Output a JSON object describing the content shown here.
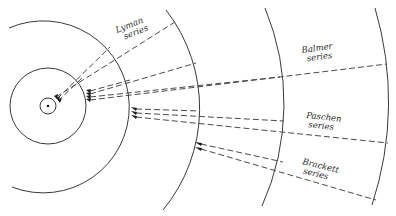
{
  "figure": {
    "type": "hydrogen-atom energy-level orbit diagram",
    "nucleus": {
      "cx": 48,
      "cy": 106
    },
    "orbits": [
      {
        "n": 1,
        "r": 8
      },
      {
        "n": 2,
        "r": 38
      },
      {
        "n": 3,
        "r": 82
      },
      {
        "n": 4,
        "r": 152
      },
      {
        "n": 5,
        "r": 238
      },
      {
        "n": 6,
        "r": 342
      }
    ],
    "series": [
      {
        "id": "lyman",
        "label_line1": "Lyman",
        "label_line2": "series",
        "target_orbit": 1
      },
      {
        "id": "balmer",
        "label_line1": "Balmer",
        "label_line2": "series",
        "target_orbit": 2
      },
      {
        "id": "paschen",
        "label_line1": "Paschen",
        "label_line2": "series",
        "target_orbit": 3
      },
      {
        "id": "brackett",
        "label_line1": "Brackett",
        "label_line2": "series",
        "target_orbit": 4
      }
    ]
  }
}
